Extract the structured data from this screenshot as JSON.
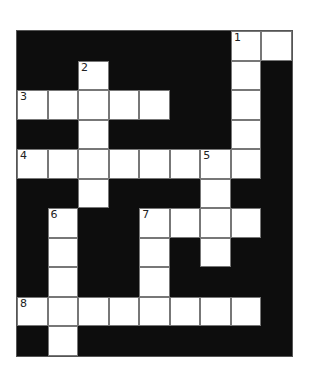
{
  "puzzle": {
    "rows": 11,
    "cols": 9,
    "white_cells": [
      [
        0,
        7
      ],
      [
        0,
        8
      ],
      [
        1,
        2
      ],
      [
        1,
        7
      ],
      [
        2,
        0
      ],
      [
        2,
        1
      ],
      [
        2,
        2
      ],
      [
        2,
        3
      ],
      [
        2,
        4
      ],
      [
        2,
        7
      ],
      [
        3,
        2
      ],
      [
        3,
        7
      ],
      [
        4,
        0
      ],
      [
        4,
        1
      ],
      [
        4,
        2
      ],
      [
        4,
        3
      ],
      [
        4,
        4
      ],
      [
        4,
        5
      ],
      [
        4,
        6
      ],
      [
        4,
        7
      ],
      [
        5,
        2
      ],
      [
        5,
        6
      ],
      [
        6,
        1
      ],
      [
        6,
        4
      ],
      [
        6,
        5
      ],
      [
        6,
        6
      ],
      [
        6,
        7
      ],
      [
        7,
        1
      ],
      [
        7,
        4
      ],
      [
        7,
        6
      ],
      [
        8,
        1
      ],
      [
        8,
        4
      ],
      [
        9,
        0
      ],
      [
        9,
        1
      ],
      [
        9,
        2
      ],
      [
        9,
        3
      ],
      [
        9,
        4
      ],
      [
        9,
        5
      ],
      [
        9,
        6
      ],
      [
        9,
        7
      ],
      [
        10,
        1
      ]
    ],
    "numbers": [
      {
        "row": 0,
        "col": 7,
        "label": "1"
      },
      {
        "row": 1,
        "col": 2,
        "label": "2"
      },
      {
        "row": 2,
        "col": 0,
        "label": "3"
      },
      {
        "row": 4,
        "col": 0,
        "label": "4"
      },
      {
        "row": 4,
        "col": 6,
        "label": "5"
      },
      {
        "row": 6,
        "col": 1,
        "label": "6"
      },
      {
        "row": 6,
        "col": 4,
        "label": "7"
      },
      {
        "row": 9,
        "col": 0,
        "label": "8"
      }
    ]
  },
  "colors": {
    "block": "#0d0d0d",
    "cell": "#ffffff",
    "line": "#777777"
  }
}
